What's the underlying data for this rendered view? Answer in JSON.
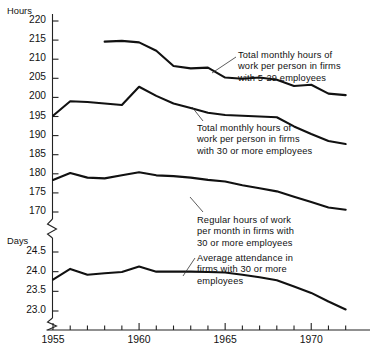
{
  "chart_data": {
    "type": "line",
    "title": "",
    "xlabel": "",
    "ylabel": "Hours",
    "ylabel_secondary": "Days",
    "grid": false,
    "legend_position": "inline-annotations",
    "broken_axis": true,
    "x": [
      1955,
      1956,
      1957,
      1958,
      1959,
      1960,
      1961,
      1962,
      1963,
      1964,
      1965,
      1966,
      1967,
      1968,
      1969,
      1970,
      1971,
      1972
    ],
    "xlim": [
      1954.4,
      1972.6
    ],
    "xticks_major": [
      1955,
      1960,
      1965,
      1970
    ],
    "xtick_labels": [
      "1955",
      "1960",
      "1965",
      "1970"
    ],
    "xticks_minor_step": 1,
    "axes": [
      {
        "name": "hours",
        "unit_label": "Hours",
        "ylim": [
          168.5,
          221.5
        ],
        "yticks": [
          170,
          175,
          180,
          185,
          190,
          195,
          200,
          205,
          210,
          215,
          220
        ],
        "ytick_labels": [
          "170",
          "175",
          "180",
          "185",
          "190",
          "195",
          "200",
          "205",
          "210",
          "215",
          "220"
        ]
      },
      {
        "name": "days",
        "unit_label": "Days",
        "ylim": [
          22.78,
          24.72
        ],
        "yticks": [
          23.0,
          23.5,
          24.0,
          24.5
        ],
        "ytick_labels": [
          "23.0",
          "23.5",
          "24.0",
          "24.5"
        ]
      }
    ],
    "series": [
      {
        "name": "Total monthly hours of work per person in firms with 5-29 employees",
        "axis": "hours",
        "color": "#111111",
        "x": [
          1958,
          1959,
          1960,
          1961,
          1962,
          1963,
          1964,
          1965,
          1966,
          1967,
          1968,
          1969,
          1970,
          1971,
          1972
        ],
        "values": [
          214.6,
          214.8,
          214.4,
          212.2,
          208.2,
          207.6,
          207.8,
          205.2,
          204.9,
          205.2,
          204.6,
          203.0,
          203.3,
          201.0,
          200.6
        ]
      },
      {
        "name": "Total monthly hours of work per person in firms with 30 or more employees",
        "axis": "hours",
        "color": "#111111",
        "x": [
          1955,
          1956,
          1957,
          1958,
          1959,
          1960,
          1961,
          1962,
          1963,
          1964,
          1965,
          1966,
          1967,
          1968,
          1969,
          1970,
          1971,
          1972
        ],
        "values": [
          195.2,
          199.0,
          198.8,
          198.4,
          198.0,
          202.8,
          200.4,
          198.4,
          197.2,
          196.0,
          195.4,
          195.2,
          195.0,
          194.8,
          192.4,
          190.4,
          188.6,
          187.8
        ]
      },
      {
        "name": "Regular hours of work per month in firms with 30 or more employees",
        "axis": "hours",
        "color": "#111111",
        "x": [
          1955,
          1956,
          1957,
          1958,
          1959,
          1960,
          1961,
          1962,
          1963,
          1964,
          1965,
          1966,
          1967,
          1968,
          1969,
          1970,
          1971,
          1972
        ],
        "values": [
          178.4,
          180.2,
          179.0,
          178.8,
          179.6,
          180.4,
          179.6,
          179.4,
          179.0,
          178.4,
          178.0,
          177.0,
          176.2,
          175.4,
          174.0,
          172.6,
          171.2,
          170.6
        ]
      },
      {
        "name": "Average attendance in firms with 30 or more employees",
        "axis": "days",
        "color": "#111111",
        "x": [
          1955,
          1956,
          1957,
          1958,
          1959,
          1960,
          1961,
          1962,
          1963,
          1964,
          1965,
          1966,
          1967,
          1968,
          1969,
          1970,
          1971,
          1972
        ],
        "values": [
          23.8,
          24.07,
          23.92,
          23.96,
          23.99,
          24.13,
          24.0,
          24.0,
          24.0,
          23.99,
          23.98,
          23.92,
          23.86,
          23.78,
          23.62,
          23.46,
          23.24,
          23.04
        ]
      }
    ],
    "annotations": [
      {
        "id": "anno-5-29",
        "lines": [
          "Total monthly hours of",
          "work per person in firms",
          "with 5-29 employees"
        ],
        "text_x": 238,
        "text_y": 50,
        "leader": [
          [
            236,
            57
          ],
          [
            212,
            73
          ]
        ]
      },
      {
        "id": "anno-30-total",
        "lines": [
          "Total monthly hours of",
          "work per person in firms",
          "with 30 or more employees"
        ],
        "text_x": 197,
        "text_y": 123,
        "leader": [
          [
            203,
            121
          ],
          [
            192,
            107
          ]
        ]
      },
      {
        "id": "anno-regular",
        "lines": [
          "Regular hours of work",
          "per month in firms with",
          "30 or more employees"
        ],
        "text_x": 197,
        "text_y": 215,
        "leader": [
          [
            203,
            212
          ],
          [
            190,
            197
          ]
        ]
      },
      {
        "id": "anno-attendance",
        "lines": [
          "Average attendance in",
          "firms with 30 or more",
          "employees"
        ],
        "text_x": 197,
        "text_y": 253,
        "leader": [
          [
            195,
            258
          ],
          [
            183,
            276
          ]
        ]
      }
    ]
  }
}
